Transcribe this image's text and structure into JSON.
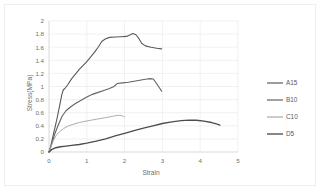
{
  "chart_data": {
    "type": "line",
    "title": "",
    "xlabel": "Strain",
    "ylabel": "Stress(MPa)",
    "xlim": [
      0,
      5
    ],
    "ylim": [
      0,
      2
    ],
    "xticks": [
      "0",
      "1",
      "2",
      "3",
      "4",
      "5"
    ],
    "yticks": [
      "0",
      "0.2",
      "0.4",
      "0.6",
      "0.8",
      "1",
      "1.2",
      "1.4",
      "1.6",
      "1.8",
      "2"
    ],
    "grid": true,
    "legend_position": "right",
    "series": [
      {
        "name": "A15",
        "color": "#5a5a5a",
        "width": 1.1,
        "points": [
          [
            0.0,
            0.0
          ],
          [
            0.05,
            0.1
          ],
          [
            0.12,
            0.28
          ],
          [
            0.2,
            0.48
          ],
          [
            0.28,
            0.7
          ],
          [
            0.34,
            0.88
          ],
          [
            0.38,
            0.95
          ],
          [
            0.42,
            0.97
          ],
          [
            0.5,
            1.03
          ],
          [
            0.6,
            1.12
          ],
          [
            0.7,
            1.19
          ],
          [
            0.8,
            1.26
          ],
          [
            0.9,
            1.32
          ],
          [
            1.0,
            1.38
          ],
          [
            1.1,
            1.45
          ],
          [
            1.2,
            1.52
          ],
          [
            1.3,
            1.6
          ],
          [
            1.4,
            1.69
          ],
          [
            1.5,
            1.73
          ],
          [
            1.6,
            1.75
          ],
          [
            1.75,
            1.755
          ],
          [
            1.9,
            1.76
          ],
          [
            2.05,
            1.765
          ],
          [
            2.15,
            1.79
          ],
          [
            2.22,
            1.81
          ],
          [
            2.3,
            1.79
          ],
          [
            2.38,
            1.73
          ],
          [
            2.45,
            1.66
          ],
          [
            2.55,
            1.62
          ],
          [
            2.7,
            1.6
          ],
          [
            2.85,
            1.585
          ],
          [
            2.98,
            1.575
          ]
        ]
      },
      {
        "name": "B10",
        "color": "#636363",
        "width": 1.1,
        "points": [
          [
            0.0,
            0.0
          ],
          [
            0.06,
            0.1
          ],
          [
            0.15,
            0.27
          ],
          [
            0.25,
            0.42
          ],
          [
            0.35,
            0.55
          ],
          [
            0.45,
            0.63
          ],
          [
            0.55,
            0.68
          ],
          [
            0.7,
            0.74
          ],
          [
            0.85,
            0.79
          ],
          [
            1.0,
            0.84
          ],
          [
            1.15,
            0.88
          ],
          [
            1.3,
            0.91
          ],
          [
            1.45,
            0.94
          ],
          [
            1.6,
            0.97
          ],
          [
            1.72,
            1.0
          ],
          [
            1.8,
            1.045
          ],
          [
            1.95,
            1.055
          ],
          [
            2.1,
            1.065
          ],
          [
            2.25,
            1.08
          ],
          [
            2.4,
            1.095
          ],
          [
            2.55,
            1.11
          ],
          [
            2.68,
            1.12
          ],
          [
            2.76,
            1.115
          ],
          [
            2.84,
            1.05
          ],
          [
            2.92,
            0.98
          ],
          [
            2.98,
            0.93
          ]
        ]
      },
      {
        "name": "C10",
        "color": "#a9a9a9",
        "width": 0.95,
        "points": [
          [
            0.0,
            0.0
          ],
          [
            0.05,
            0.08
          ],
          [
            0.12,
            0.18
          ],
          [
            0.2,
            0.26
          ],
          [
            0.28,
            0.31
          ],
          [
            0.38,
            0.355
          ],
          [
            0.5,
            0.395
          ],
          [
            0.65,
            0.425
          ],
          [
            0.8,
            0.45
          ],
          [
            0.95,
            0.468
          ],
          [
            1.1,
            0.484
          ],
          [
            1.25,
            0.5
          ],
          [
            1.4,
            0.515
          ],
          [
            1.55,
            0.53
          ],
          [
            1.68,
            0.545
          ],
          [
            1.78,
            0.555
          ],
          [
            1.86,
            0.56
          ],
          [
            1.92,
            0.555
          ],
          [
            1.97,
            0.545
          ],
          [
            2.0,
            0.535
          ]
        ]
      },
      {
        "name": "D5",
        "color": "#4d4d4d",
        "width": 1.35,
        "points": [
          [
            0.0,
            0.0
          ],
          [
            0.08,
            0.04
          ],
          [
            0.18,
            0.065
          ],
          [
            0.3,
            0.08
          ],
          [
            0.45,
            0.09
          ],
          [
            0.6,
            0.1
          ],
          [
            0.8,
            0.115
          ],
          [
            1.0,
            0.135
          ],
          [
            1.25,
            0.165
          ],
          [
            1.5,
            0.2
          ],
          [
            1.75,
            0.245
          ],
          [
            2.0,
            0.285
          ],
          [
            2.25,
            0.325
          ],
          [
            2.5,
            0.365
          ],
          [
            2.75,
            0.4
          ],
          [
            3.0,
            0.435
          ],
          [
            3.25,
            0.46
          ],
          [
            3.5,
            0.478
          ],
          [
            3.7,
            0.487
          ],
          [
            3.9,
            0.485
          ],
          [
            4.1,
            0.472
          ],
          [
            4.3,
            0.45
          ],
          [
            4.45,
            0.425
          ],
          [
            4.52,
            0.41
          ]
        ]
      }
    ]
  },
  "legend": {
    "items": [
      {
        "label": "A15"
      },
      {
        "label": "B10"
      },
      {
        "label": "C10"
      },
      {
        "label": "D5"
      }
    ]
  }
}
